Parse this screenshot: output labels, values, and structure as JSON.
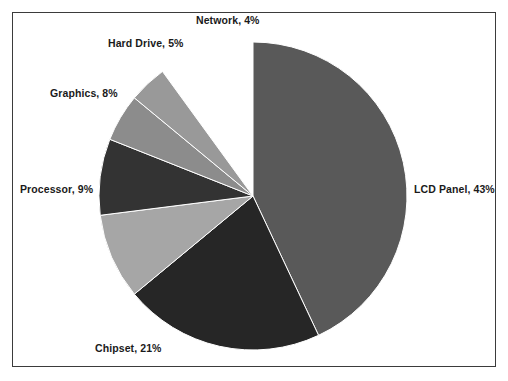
{
  "chart_data": {
    "type": "pie",
    "title": "",
    "subtitle": "",
    "xlabel": "",
    "ylabel": "",
    "legend_position": "none",
    "labels_position": "outside",
    "grid": false,
    "start_angle_deg": 0,
    "direction": "clockwise",
    "units": "%",
    "categories": [
      "LCD Panel",
      "Chipset",
      "Processor",
      "Graphics",
      "Hard Drive",
      "Network"
    ],
    "values": [
      43,
      21,
      9,
      8,
      5,
      4
    ],
    "colors": [
      "#595959",
      "#262626",
      "#a6a6a6",
      "#333333",
      "#8c8c8c",
      "#999999"
    ],
    "slices": [
      {
        "name": "LCD Panel",
        "value": 43,
        "label": "LCD Panel, 43%",
        "color": "#595959",
        "start_deg": 0,
        "end_deg": 154.8,
        "label_x": 414,
        "label_y": 183,
        "label_align": "right"
      },
      {
        "name": "Chipset",
        "value": 21,
        "label": "Chipset, 21%",
        "color": "#262626",
        "start_deg": 154.8,
        "end_deg": 230.4,
        "label_x": 95,
        "label_y": 342,
        "label_align": "center"
      },
      {
        "name": "Processor",
        "value": 9,
        "label": "Processor, 9%",
        "color": "#a6a6a6",
        "start_deg": 230.4,
        "end_deg": 262.8,
        "label_x": 20,
        "label_y": 183,
        "label_align": "center"
      },
      {
        "name": "Graphics",
        "value": 8,
        "label": "Graphics, 8%",
        "color": "#333333",
        "start_deg": 262.8,
        "end_deg": 291.6,
        "label_x": 50,
        "label_y": 87,
        "label_align": "center"
      },
      {
        "name": "Hard Drive",
        "value": 5,
        "label": "Hard Drive, 5%",
        "color": "#8c8c8c",
        "start_deg": 291.6,
        "end_deg": 309.6,
        "label_x": 108,
        "label_y": 37,
        "label_align": "center"
      },
      {
        "name": "Network",
        "value": 4,
        "label": "Network, 4%",
        "color": "#999999",
        "start_deg": 309.6,
        "end_deg": 324.0,
        "label_x": 196,
        "label_y": 14,
        "label_align": "center"
      }
    ],
    "geometry": {
      "center_x": 253,
      "center_y": 196,
      "radius": 154,
      "separator_color": "#ffffff",
      "separator_width": 1
    },
    "frame": {
      "border_color": "#3b3b3b",
      "background": "#ffffff"
    }
  }
}
